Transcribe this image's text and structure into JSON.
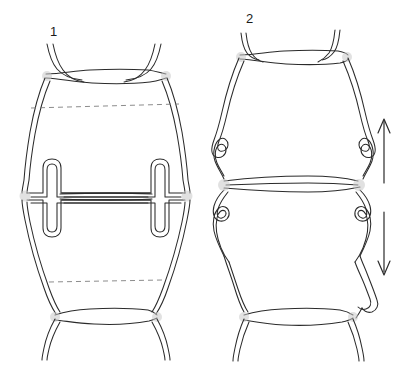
{
  "figure": {
    "background_color": "#ffffff",
    "line_color": "#2b2b2b",
    "dash_color": "#777777",
    "node_color": "#c8c8c8",
    "width": 405,
    "height": 380
  },
  "panels": [
    {
      "id": "panel-1",
      "label": "1",
      "label_x": 50,
      "label_y": 33,
      "description": "Cell pair with straight, smooth lateral walls and internal T-shaped hairpin ingrowths at the transverse wall",
      "wall_type": "straight",
      "dashed_lines": 2
    },
    {
      "id": "panel-2",
      "label": "2",
      "label_x": 246,
      "label_y": 20,
      "description": "Cell pair with sinuous, undulating lateral walls and looped interlocking margins at the transverse wall",
      "wall_type": "sinuous",
      "dashed_lines": 0
    }
  ],
  "annotations": {
    "arrow_up": {
      "name": "up-arrow",
      "direction": "up",
      "x": 384,
      "y_top": 118,
      "y_bottom": 183
    },
    "arrow_down": {
      "name": "down-arrow",
      "direction": "down",
      "x": 384,
      "y_top": 212,
      "y_bottom": 275
    }
  },
  "paths": {
    "fig1": {
      "upper_cell_outer": "M 47,43 C 48,55 50,62 56,70 C 60,75 64,78 66,80 L 55,105 L 46,145 C 44,158 42,168 40,178 L 40,188",
      "upper_cell_outer_right": "M 160,43 C 159,55 157,62 151,70 C 147,75 143,78 141,80 L 152,105 L 161,145 C 163,158 165,168 167,178 L 167,188",
      "top_wall_upper": "M 47,43 C 52,58 58,68 70,73 C 90,78 125,78 146,73 C 156,68 160,56 161,43",
      "top_wall_lower": "M 40,76 C 52,72 62,80 72,83 C 95,87 120,87 140,83 C 150,80 158,72 168,76"
    }
  }
}
